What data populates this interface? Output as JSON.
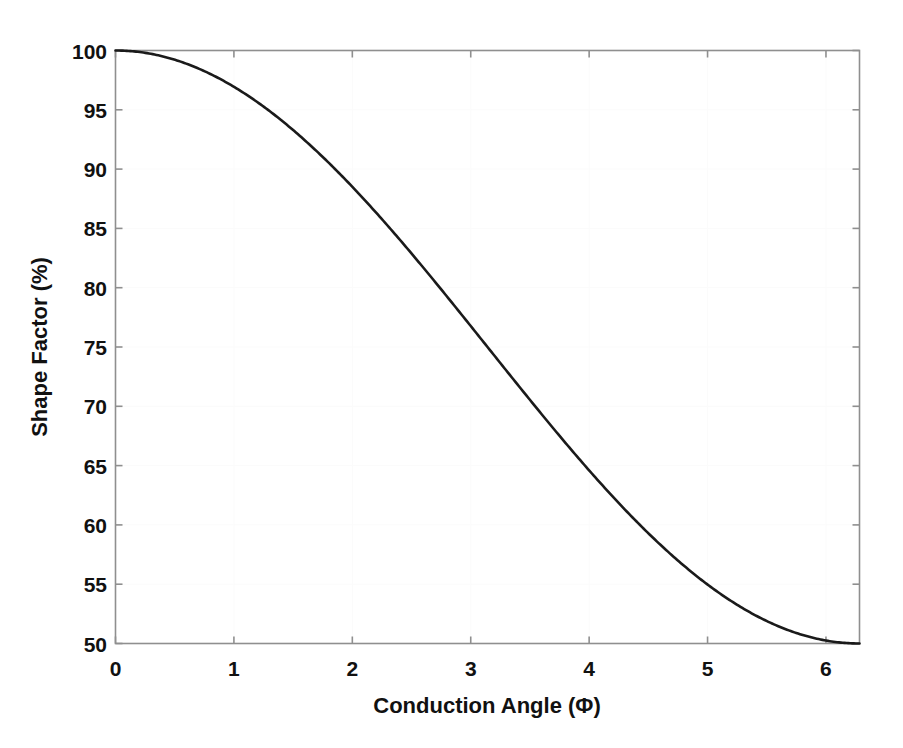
{
  "chart_data": {
    "type": "line",
    "title": "",
    "xlabel": "Conduction Angle (Φ)",
    "ylabel": "Shape Factor (%)",
    "xlim": [
      0,
      6.2832
    ],
    "ylim": [
      50,
      100
    ],
    "xticks": [
      0,
      1,
      2,
      3,
      4,
      5,
      6
    ],
    "xticklabels": [
      "0",
      "1",
      "2",
      "3",
      "4",
      "5",
      "6"
    ],
    "yticks": [
      50,
      55,
      60,
      65,
      70,
      75,
      80,
      85,
      90,
      95,
      100
    ],
    "yticklabels": [
      "50",
      "55",
      "60",
      "65",
      "70",
      "75",
      "80",
      "85",
      "90",
      "95",
      "100"
    ],
    "grid": false,
    "legend": null,
    "series": [
      {
        "name": "Shape Factor",
        "color": "#1a1a1a",
        "linewidth": 2.6,
        "formula": "75 + 25*cos(phi/2)",
        "x": [
          0.0,
          0.1571,
          0.3142,
          0.4712,
          0.6283,
          0.7854,
          0.9425,
          1.0996,
          1.2566,
          1.4137,
          1.5708,
          1.7279,
          1.885,
          2.042,
          2.1991,
          2.3562,
          2.5133,
          2.6704,
          2.8274,
          2.9845,
          3.1416,
          3.2987,
          3.4558,
          3.6128,
          3.7699,
          3.927,
          4.0841,
          4.2412,
          4.3982,
          4.5553,
          4.7124,
          4.8695,
          5.0265,
          5.1836,
          5.3407,
          5.4978,
          5.6549,
          5.8119,
          5.969,
          6.1261,
          6.2832
        ],
        "y": [
          100.0,
          99.85,
          99.39,
          98.63,
          97.58,
          96.23,
          94.6,
          92.7,
          90.53,
          88.12,
          85.49,
          82.64,
          79.61,
          76.41,
          73.08,
          69.63,
          66.1,
          62.51,
          58.9,
          55.29,
          51.72,
          48.22,
          44.82,
          41.55,
          38.44,
          35.51,
          32.8,
          30.32,
          28.09,
          26.14,
          24.48,
          23.12,
          22.08,
          21.36,
          20.97,
          20.92,
          21.19,
          21.79,
          22.72,
          23.96,
          25.5
        ]
      }
    ],
    "note_points": [
      {
        "x": 0,
        "y": 100
      },
      {
        "x": 1,
        "y": 96.88
      },
      {
        "x": 2,
        "y": 88.51
      },
      {
        "x": 3.1416,
        "y": 75.0
      },
      {
        "x": 4,
        "y": 64.76
      },
      {
        "x": 5,
        "y": 55.02
      },
      {
        "x": 6.2832,
        "y": 50.0
      }
    ]
  },
  "axes": {
    "x_tick_labels": [
      "0",
      "1",
      "2",
      "3",
      "4",
      "5",
      "6"
    ],
    "y_tick_labels": [
      "100",
      "95",
      "90",
      "85",
      "80",
      "75",
      "70",
      "65",
      "60",
      "55",
      "50"
    ],
    "x_axis_title": "Conduction Angle (Φ)",
    "y_axis_title": "Shape Factor (%)"
  },
  "colors": {
    "curve": "#1a1a1a",
    "axis": "#8f8f8f",
    "grid": "#fbfbfb",
    "text": "#111111",
    "background": "#ffffff"
  }
}
